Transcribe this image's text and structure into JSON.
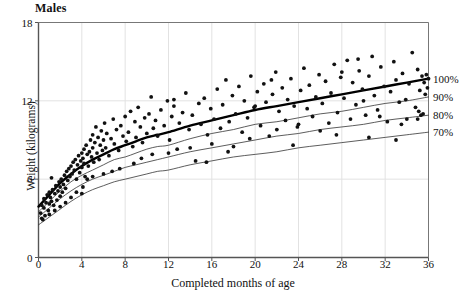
{
  "chart_data": {
    "type": "scatter",
    "title": "Males",
    "xlabel": "Completed months of age",
    "ylabel": "Weight (kilograms)",
    "xlim": [
      0,
      36
    ],
    "ylim": [
      0,
      18
    ],
    "xticks": [
      "0",
      "4",
      "8",
      "12",
      "16",
      "20",
      "24",
      "28",
      "32",
      "36"
    ],
    "yticks": [
      "0",
      "6",
      "12",
      "18"
    ],
    "grid": true,
    "legend_position": "right-outside",
    "reference_curves": [
      {
        "name": "100%",
        "label": "100%",
        "style": "thick",
        "color": "#000000",
        "x": [
          0,
          1,
          2,
          3,
          4,
          5,
          6,
          7,
          8,
          9,
          10,
          11,
          12,
          14,
          16,
          18,
          20,
          22,
          24,
          26,
          28,
          30,
          32,
          34,
          36
        ],
        "y": [
          3.9,
          4.8,
          5.7,
          6.4,
          7.0,
          7.5,
          7.9,
          8.3,
          8.6,
          8.9,
          9.2,
          9.4,
          9.6,
          10.1,
          10.5,
          10.9,
          11.3,
          11.6,
          11.9,
          12.2,
          12.5,
          12.8,
          13.1,
          13.4,
          13.7
        ]
      },
      {
        "name": "90%",
        "label": "90%",
        "style": "thin",
        "color": "#333333",
        "x": [
          0,
          1,
          2,
          3,
          4,
          5,
          6,
          7,
          8,
          9,
          10,
          11,
          12,
          14,
          16,
          18,
          20,
          22,
          24,
          26,
          28,
          30,
          32,
          34,
          36
        ],
        "y": [
          3.5,
          4.3,
          5.1,
          5.8,
          6.3,
          6.7,
          7.1,
          7.5,
          7.7,
          8.0,
          8.3,
          8.5,
          8.6,
          9.1,
          9.5,
          9.8,
          10.2,
          10.4,
          10.7,
          11.0,
          11.2,
          11.5,
          11.8,
          12.0,
          12.3
        ]
      },
      {
        "name": "80%",
        "label": "80%",
        "style": "thin",
        "color": "#333333",
        "x": [
          0,
          1,
          2,
          3,
          4,
          5,
          6,
          7,
          8,
          9,
          10,
          11,
          12,
          14,
          16,
          18,
          20,
          22,
          24,
          26,
          28,
          30,
          32,
          34,
          36
        ],
        "y": [
          3.1,
          3.8,
          4.5,
          5.1,
          5.6,
          6.0,
          6.3,
          6.6,
          6.9,
          7.1,
          7.3,
          7.5,
          7.7,
          8.1,
          8.4,
          8.7,
          9.0,
          9.3,
          9.5,
          9.8,
          10.0,
          10.2,
          10.5,
          10.7,
          10.9
        ]
      },
      {
        "name": "70%",
        "label": "70%",
        "style": "thin",
        "color": "#333333",
        "x": [
          0,
          1,
          2,
          3,
          4,
          5,
          6,
          7,
          8,
          9,
          10,
          11,
          12,
          14,
          16,
          18,
          20,
          22,
          24,
          26,
          28,
          30,
          32,
          34,
          36
        ],
        "y": [
          2.5,
          3.1,
          3.7,
          4.3,
          4.8,
          5.2,
          5.5,
          5.8,
          6.0,
          6.2,
          6.4,
          6.6,
          6.7,
          7.1,
          7.4,
          7.7,
          7.9,
          8.1,
          8.4,
          8.6,
          8.8,
          9.0,
          9.2,
          9.4,
          9.6
        ]
      }
    ],
    "points": [
      [
        0.2,
        3.4
      ],
      [
        0.3,
        3.0
      ],
      [
        0.3,
        4.0
      ],
      [
        0.5,
        3.8
      ],
      [
        0.5,
        4.5
      ],
      [
        0.6,
        3.2
      ],
      [
        0.7,
        4.2
      ],
      [
        0.8,
        4.8
      ],
      [
        0.9,
        3.6
      ],
      [
        1.0,
        4.1
      ],
      [
        1.0,
        5.0
      ],
      [
        1.1,
        4.6
      ],
      [
        1.2,
        6.1
      ],
      [
        1.2,
        4.3
      ],
      [
        1.3,
        5.2
      ],
      [
        1.4,
        4.0
      ],
      [
        1.5,
        4.9
      ],
      [
        1.6,
        5.5
      ],
      [
        1.7,
        4.4
      ],
      [
        1.8,
        5.1
      ],
      [
        1.9,
        5.8
      ],
      [
        2.0,
        4.7
      ],
      [
        2.0,
        5.4
      ],
      [
        2.1,
        6.0
      ],
      [
        2.2,
        5.0
      ],
      [
        2.3,
        5.6
      ],
      [
        2.4,
        6.3
      ],
      [
        2.5,
        5.3
      ],
      [
        2.6,
        6.6
      ],
      [
        2.7,
        5.9
      ],
      [
        2.8,
        6.8
      ],
      [
        2.9,
        6.2
      ],
      [
        3.0,
        7.0
      ],
      [
        3.1,
        6.4
      ],
      [
        3.2,
        7.3
      ],
      [
        3.3,
        6.7
      ],
      [
        3.4,
        7.5
      ],
      [
        3.5,
        6.0
      ],
      [
        3.6,
        7.1
      ],
      [
        3.7,
        7.8
      ],
      [
        3.8,
        6.5
      ],
      [
        3.9,
        7.4
      ],
      [
        4.0,
        8.0
      ],
      [
        4.0,
        6.9
      ],
      [
        4.1,
        7.6
      ],
      [
        4.1,
        5.4
      ],
      [
        4.2,
        8.3
      ],
      [
        4.2,
        7.2
      ],
      [
        4.3,
        6.2
      ],
      [
        4.4,
        8.6
      ],
      [
        4.5,
        7.9
      ],
      [
        4.6,
        7.0
      ],
      [
        4.7,
        8.1
      ],
      [
        4.8,
        9.0
      ],
      [
        4.9,
        7.7
      ],
      [
        5.0,
        8.4
      ],
      [
        5.0,
        9.4
      ],
      [
        5.1,
        7.3
      ],
      [
        5.2,
        8.8
      ],
      [
        5.3,
        10.0
      ],
      [
        5.4,
        8.0
      ],
      [
        5.5,
        9.2
      ],
      [
        5.6,
        7.5
      ],
      [
        5.7,
        8.6
      ],
      [
        5.8,
        9.7
      ],
      [
        5.9,
        8.2
      ],
      [
        6.0,
        9.0
      ],
      [
        6.1,
        10.3
      ],
      [
        6.2,
        8.4
      ],
      [
        6.3,
        9.5
      ],
      [
        6.5,
        7.8
      ],
      [
        6.7,
        9.1
      ],
      [
        6.9,
        10.6
      ],
      [
        7.0,
        8.7
      ],
      [
        7.2,
        9.8
      ],
      [
        7.4,
        8.2
      ],
      [
        7.6,
        10.1
      ],
      [
        7.8,
        9.3
      ],
      [
        8.0,
        10.8
      ],
      [
        8.1,
        8.9
      ],
      [
        8.3,
        9.6
      ],
      [
        8.5,
        11.2
      ],
      [
        8.7,
        8.5
      ],
      [
        8.9,
        10.4
      ],
      [
        9.0,
        9.2
      ],
      [
        9.2,
        11.5
      ],
      [
        9.4,
        10.0
      ],
      [
        9.6,
        8.8
      ],
      [
        9.8,
        10.7
      ],
      [
        10.0,
        9.5
      ],
      [
        10.2,
        11.0
      ],
      [
        10.4,
        12.3
      ],
      [
        10.6,
        9.9
      ],
      [
        10.8,
        10.5
      ],
      [
        11.0,
        9.3
      ],
      [
        11.3,
        11.3
      ],
      [
        11.6,
        10.1
      ],
      [
        11.9,
        12.0
      ],
      [
        12.1,
        9.0
      ],
      [
        12.3,
        10.8
      ],
      [
        12.5,
        11.6
      ],
      [
        12.8,
        8.3
      ],
      [
        13.0,
        10.3
      ],
      [
        13.3,
        11.1
      ],
      [
        13.6,
        12.6
      ],
      [
        13.9,
        9.8
      ],
      [
        14.2,
        10.9
      ],
      [
        14.5,
        7.4
      ],
      [
        14.8,
        11.8
      ],
      [
        15.0,
        10.2
      ],
      [
        15.3,
        12.2
      ],
      [
        15.6,
        9.4
      ],
      [
        15.9,
        11.4
      ],
      [
        16.2,
        10.6
      ],
      [
        16.5,
        12.9
      ],
      [
        16.8,
        9.9
      ],
      [
        17.0,
        11.7
      ],
      [
        17.3,
        13.6
      ],
      [
        17.6,
        10.4
      ],
      [
        17.9,
        12.4
      ],
      [
        18.2,
        11.0
      ],
      [
        18.5,
        13.1
      ],
      [
        18.8,
        9.6
      ],
      [
        19.0,
        12.0
      ],
      [
        19.3,
        10.7
      ],
      [
        19.6,
        13.9
      ],
      [
        19.9,
        11.5
      ],
      [
        20.2,
        12.7
      ],
      [
        20.5,
        10.1
      ],
      [
        20.8,
        13.3
      ],
      [
        21.0,
        11.9
      ],
      [
        21.3,
        9.3
      ],
      [
        21.6,
        12.5
      ],
      [
        21.9,
        14.2
      ],
      [
        22.2,
        11.2
      ],
      [
        22.5,
        13.0
      ],
      [
        22.8,
        10.5
      ],
      [
        23.0,
        12.1
      ],
      [
        23.3,
        13.7
      ],
      [
        23.6,
        11.6
      ],
      [
        23.9,
        10.0
      ],
      [
        24.2,
        12.8
      ],
      [
        24.5,
        14.5
      ],
      [
        24.8,
        11.4
      ],
      [
        25.0,
        13.2
      ],
      [
        25.3,
        10.8
      ],
      [
        25.6,
        12.3
      ],
      [
        25.9,
        14.0
      ],
      [
        26.2,
        11.8
      ],
      [
        26.5,
        13.5
      ],
      [
        26.8,
        10.3
      ],
      [
        27.0,
        12.6
      ],
      [
        27.3,
        14.8
      ],
      [
        27.6,
        11.1
      ],
      [
        27.9,
        13.8
      ],
      [
        28.2,
        12.2
      ],
      [
        28.5,
        15.1
      ],
      [
        28.8,
        10.6
      ],
      [
        29.0,
        13.4
      ],
      [
        29.3,
        11.7
      ],
      [
        29.6,
        14.3
      ],
      [
        29.9,
        12.9
      ],
      [
        30.2,
        10.9
      ],
      [
        30.5,
        13.9
      ],
      [
        30.8,
        15.4
      ],
      [
        31.0,
        12.4
      ],
      [
        31.3,
        11.3
      ],
      [
        31.6,
        14.6
      ],
      [
        31.9,
        13.1
      ],
      [
        32.2,
        10.4
      ],
      [
        32.5,
        12.7
      ],
      [
        32.8,
        15.0
      ],
      [
        33.0,
        13.6
      ],
      [
        33.3,
        11.9
      ],
      [
        33.6,
        14.1
      ],
      [
        33.9,
        12.1
      ],
      [
        34.2,
        13.3
      ],
      [
        34.5,
        15.7
      ],
      [
        34.8,
        11.5
      ],
      [
        35.0,
        14.4
      ],
      [
        35.2,
        12.8
      ],
      [
        35.4,
        13.9
      ],
      [
        35.5,
        11.0
      ],
      [
        35.6,
        13.4
      ],
      [
        35.7,
        12.5
      ],
      [
        35.8,
        14.0
      ],
      [
        35.9,
        13.0
      ],
      [
        36.0,
        13.7
      ],
      [
        35.3,
        10.9
      ],
      [
        35.1,
        11.2
      ],
      [
        34.0,
        10.6
      ],
      [
        33.5,
        10.2
      ],
      [
        30.0,
        12.0
      ],
      [
        26.0,
        9.7
      ],
      [
        22.0,
        9.8
      ],
      [
        19.5,
        9.1
      ],
      [
        18.0,
        8.5
      ],
      [
        16.0,
        8.7
      ],
      [
        14.0,
        8.4
      ],
      [
        12.0,
        8.0
      ],
      [
        10.5,
        7.9
      ],
      [
        9.5,
        7.6
      ],
      [
        8.8,
        7.2
      ],
      [
        7.5,
        6.8
      ],
      [
        6.8,
        6.6
      ],
      [
        6.0,
        6.4
      ],
      [
        5.0,
        6.2
      ],
      [
        4.5,
        6.0
      ],
      [
        4.0,
        4.9
      ],
      [
        3.5,
        5.0
      ],
      [
        3.0,
        4.6
      ],
      [
        2.5,
        4.2
      ],
      [
        2.0,
        3.9
      ],
      [
        1.5,
        3.6
      ],
      [
        1.0,
        3.3
      ],
      [
        0.4,
        2.9
      ],
      [
        20.0,
        11.6
      ],
      [
        21.5,
        13.6
      ],
      [
        24.0,
        10.2
      ],
      [
        28.0,
        14.2
      ],
      [
        29.5,
        15.2
      ],
      [
        31.5,
        10.8
      ],
      [
        12.5,
        12.1
      ],
      [
        15.5,
        7.3
      ],
      [
        17.5,
        8.1
      ],
      [
        23.5,
        8.6
      ],
      [
        27.5,
        9.4
      ],
      [
        30.5,
        9.2
      ],
      [
        33.0,
        9.0
      ],
      [
        35.0,
        10.6
      ]
    ]
  }
}
